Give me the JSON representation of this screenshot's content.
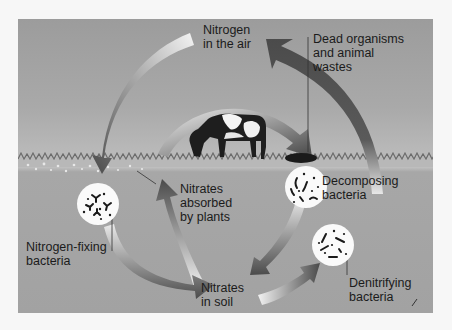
{
  "diagram": {
    "colors": {
      "sky": "#a4a4a4",
      "soil": "#a3a3a3",
      "arrow_dark": "#4a4a4a",
      "arrow_light": "#f2f2f2",
      "bacteria_circle": "#fafafa",
      "text": "#1b1b1b"
    },
    "labels": {
      "nitrogen_air": "Nitrogen\nin the air",
      "dead_organisms": "Dead organisms\nand animal\nwastes",
      "nitrates_absorbed": "Nitrates\nabsorbed\nby plants",
      "decomposing": "Decomposing\nbacteria",
      "nitrogen_fixing": "Nitrogen-fixing\nbacteria",
      "nitrates_soil": "Nitrates\nin soil",
      "denitrifying": "Denitrifying\nbacteria"
    },
    "nodes": [
      {
        "id": "nitrogen-air",
        "label": "Nitrogen in the air"
      },
      {
        "id": "dead-organisms",
        "label": "Dead organisms and animal wastes"
      },
      {
        "id": "decomposing-bacteria",
        "label": "Decomposing bacteria"
      },
      {
        "id": "nitrates-soil",
        "label": "Nitrates in soil"
      },
      {
        "id": "nitrates-absorbed",
        "label": "Nitrates absorbed by plants"
      },
      {
        "id": "nitrogen-fixing-bacteria",
        "label": "Nitrogen-fixing bacteria"
      },
      {
        "id": "denitrifying-bacteria",
        "label": "Denitrifying bacteria"
      }
    ],
    "edges": [
      {
        "from": "nitrogen-air",
        "to": "nitrogen-fixing-bacteria"
      },
      {
        "from": "nitrogen-fixing-bacteria",
        "to": "nitrates-soil"
      },
      {
        "from": "nitrates-soil",
        "to": "nitrates-absorbed"
      },
      {
        "from": "nitrates-absorbed",
        "to": "dead-organisms"
      },
      {
        "from": "dead-organisms",
        "to": "decomposing-bacteria"
      },
      {
        "from": "decomposing-bacteria",
        "to": "nitrates-soil"
      },
      {
        "from": "nitrates-soil",
        "to": "denitrifying-bacteria"
      },
      {
        "from": "denitrifying-bacteria",
        "to": "nitrogen-air"
      }
    ]
  }
}
